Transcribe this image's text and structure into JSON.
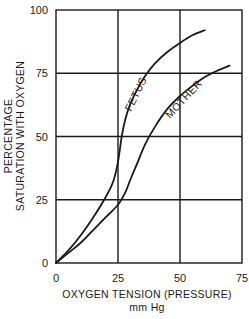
{
  "chart_data": {
    "type": "line",
    "title": "",
    "xlabel": "OXYGEN TENSION (PRESSURE)",
    "xlabel_unit": "mm Hg",
    "ylabel_line1": "PERCENTAGE",
    "ylabel_line2": "SATURATION WITH OXYGEN",
    "xlim": [
      0,
      75
    ],
    "ylim": [
      0,
      100
    ],
    "xticks": [
      0,
      25,
      50,
      75
    ],
    "yticks": [
      0,
      25,
      50,
      75,
      100
    ],
    "xtick_labels": [
      "0",
      "25",
      "50",
      "75"
    ],
    "ytick_labels": [
      "0",
      "25",
      "50",
      "75",
      "100"
    ],
    "grid": true,
    "legend": "inline curve labels",
    "series": [
      {
        "name": "FETUS",
        "x": [
          0,
          5,
          10,
          15,
          20,
          23,
          25,
          26.5,
          28,
          30,
          33,
          36,
          40,
          45,
          50,
          55,
          60
        ],
        "y": [
          0,
          5,
          11,
          18,
          26,
          32,
          40,
          50,
          57,
          63,
          69,
          74,
          79,
          83.5,
          87,
          90,
          92
        ]
      },
      {
        "name": "MOTHER",
        "x": [
          0,
          5,
          10,
          15,
          20,
          25,
          28,
          30,
          33,
          36,
          40,
          45,
          50,
          55,
          60,
          65,
          70
        ],
        "y": [
          0,
          4,
          8,
          13,
          18,
          23,
          28,
          33,
          40,
          47,
          54,
          61,
          66,
          70,
          73.5,
          76,
          78
        ]
      }
    ]
  }
}
